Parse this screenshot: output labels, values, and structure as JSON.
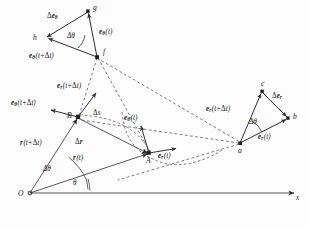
{
  "figure": {
    "colors": {
      "stroke": "#3a3a3a",
      "dashed": "#555555",
      "text": "#1a1a1a",
      "background": "#ffffff"
    }
  },
  "points": {
    "origin": "O",
    "A": "A",
    "B": "B",
    "f": "f",
    "g": "g",
    "h": "h",
    "a": "a",
    "b": "b",
    "c": "c"
  },
  "axes": {
    "x_label": "x"
  },
  "angles": {
    "theta": "θ",
    "delta_theta_origin": "Δθ",
    "delta_theta_top": "Δθ",
    "delta_theta_right": "Δθ"
  },
  "vectors": {
    "r_t": {
      "base": "r",
      "sub": "",
      "arg": "(t)"
    },
    "r_t_dt": {
      "base": "r",
      "sub": "",
      "arg": "(t+Δt)"
    },
    "delta_r": {
      "base": "Δr",
      "sub": "",
      "arg": ""
    },
    "delta_s": {
      "base": "Δs",
      "sub": "",
      "arg": ""
    },
    "e_r_t_A": {
      "base": "e",
      "sub": "r",
      "arg": "(t)"
    },
    "e_theta_t_A": {
      "base": "e",
      "sub": "θ",
      "arg": "(t)"
    },
    "e_r_t_dt_B": {
      "base": "e",
      "sub": "r",
      "arg": "(t+Δt)"
    },
    "e_theta_t_dt_B": {
      "base": "e",
      "sub": "θ",
      "arg": "(t+Δt)"
    },
    "e_theta_t_top": {
      "base": "e",
      "sub": "θ",
      "arg": "(t)"
    },
    "e_theta_t_dt_top": {
      "base": "e",
      "sub": "θ",
      "arg": "(t+Δt)"
    },
    "delta_e_theta": {
      "base": "Δe",
      "sub": "θ",
      "arg": ""
    },
    "e_r_t_right": {
      "base": "e",
      "sub": "r",
      "arg": "(t)"
    },
    "e_r_t_dt_right": {
      "base": "e",
      "sub": "r",
      "arg": "(t+Δt)"
    },
    "delta_e_r": {
      "base": "Δe",
      "sub": "r",
      "arg": ""
    }
  },
  "labels": {
    "delta_e_theta_text": "Δeθ",
    "e_theta_t_text": "eθ(t)",
    "e_theta_t_dt_text": "eθ(t+Δt)",
    "e_r_t_dt_B_text": "er(t+Δt)",
    "e_theta_t_dt_B_text": "eθ(t+Δt)",
    "r_t_dt_text": "r(t+Δt)",
    "r_t_text": "r(t)",
    "delta_r_text": "Δr",
    "delta_s_text": "Δs",
    "e_theta_t_A_text": "eθ(t)",
    "e_r_t_A_text": "er(t)",
    "e_r_t_dt_right_text": "er(t+Δt)",
    "delta_e_r_text": "Δer",
    "e_r_t_right_text": "er(t)"
  },
  "geometry": {
    "origin": [
      30,
      193
    ],
    "A": [
      149,
      153
    ],
    "B": [
      78,
      117
    ],
    "f": [
      97,
      57
    ],
    "g": [
      88,
      11
    ],
    "h": [
      44,
      38
    ],
    "a": [
      240,
      143
    ],
    "b": [
      288,
      118
    ],
    "c": [
      262,
      91
    ],
    "x_axis_end": [
      296,
      193
    ]
  }
}
